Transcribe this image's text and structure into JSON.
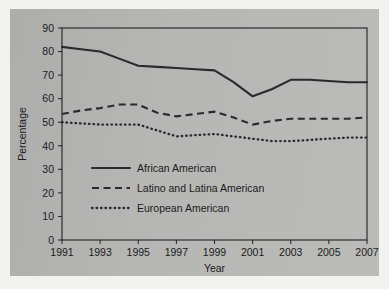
{
  "chart_data": {
    "type": "line",
    "title": "",
    "xlabel": "Year",
    "ylabel": "Percentage",
    "xlim": [
      1991,
      2007
    ],
    "ylim": [
      0,
      90
    ],
    "ytick_step": 10,
    "xtick_step": 2,
    "grid": false,
    "legend_position": "center-left-inside",
    "yticks": [
      "0",
      "10",
      "20",
      "30",
      "40",
      "50",
      "60",
      "70",
      "80",
      "90"
    ],
    "xticks": [
      "1991",
      "1993",
      "1995",
      "1997",
      "1999",
      "2001",
      "2003",
      "2005",
      "2007"
    ],
    "x": [
      1991,
      1992,
      1993,
      1994,
      1995,
      1996,
      1997,
      1998,
      1999,
      2000,
      2001,
      2002,
      2003,
      2004,
      2005,
      2006,
      2007
    ],
    "series": [
      {
        "name": "African American",
        "style": "solid",
        "color": "#2a2a2a",
        "values": [
          82,
          81,
          80,
          77,
          74,
          73.5,
          73,
          72.5,
          72,
          67,
          61,
          64,
          68,
          68,
          67.5,
          67,
          67
        ]
      },
      {
        "name": "Latino and Latina American",
        "style": "dashed",
        "color": "#2a2a2a",
        "values": [
          53.5,
          55,
          56,
          57.5,
          57.5,
          54,
          52.5,
          53.5,
          54.5,
          52,
          49,
          50.5,
          51.5,
          51.5,
          51.5,
          51.5,
          52
        ]
      },
      {
        "name": "European American",
        "style": "dotted",
        "color": "#2a2a2a",
        "values": [
          50,
          49.5,
          49,
          49,
          49,
          46.5,
          44,
          44.5,
          45,
          44,
          43,
          42,
          42,
          42.5,
          43,
          43.5,
          43.5
        ]
      }
    ]
  },
  "legend": {
    "items": [
      {
        "label": "African American",
        "style": "solid"
      },
      {
        "label": "Latino and Latina American",
        "style": "dashed"
      },
      {
        "label": "European American",
        "style": "dotted"
      }
    ]
  },
  "axes": {
    "y_title": "Percentage",
    "x_title": "Year"
  },
  "colors": {
    "panel_background": "#b3b3b1",
    "page_background": "#f2f2f0",
    "ink": "#2a2a2a"
  }
}
